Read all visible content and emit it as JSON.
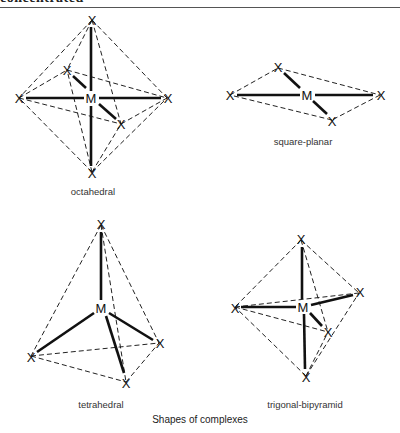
{
  "header": {
    "text": "concentrated"
  },
  "figure": {
    "caption": "Shapes of complexes",
    "atoms": {
      "central": "M",
      "ligand": "X"
    },
    "shapes": [
      {
        "name": "octahedral",
        "label": "octahedral"
      },
      {
        "name": "square-planar",
        "label": "square-planar"
      },
      {
        "name": "tetrahedral",
        "label": "tetrahedral"
      },
      {
        "name": "trigonal-bipyramid",
        "label": "trigonal-bipyramid"
      }
    ]
  }
}
